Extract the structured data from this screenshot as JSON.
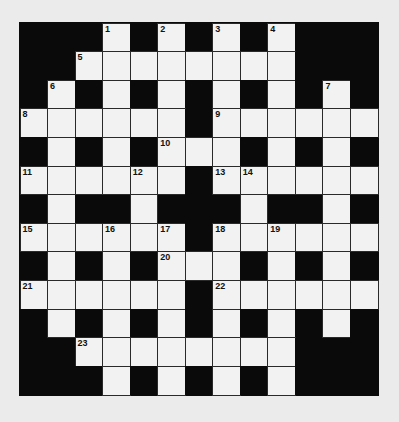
{
  "puzzle": {
    "type": "crossword",
    "rows": 13,
    "cols": 13,
    "colors": {
      "page_background": "#ebebeb",
      "block": "#0a0a0a",
      "cell": "#f2f2f2",
      "number": "#111111"
    },
    "grid": [
      "###.#.#.#.###",
      "##........###",
      "#.#.#.#.#.#.#",
      "......#......",
      "#.#.#...#.#.#",
      "......#......",
      "#.##.###.##.#",
      "......#......",
      "#.#.#...#.#.#",
      "......#......",
      "#.#.#.#.#.#.#",
      "##........###",
      "###.#.#.#.###"
    ],
    "numbers": [
      {
        "n": "1",
        "r": 0,
        "c": 3
      },
      {
        "n": "2",
        "r": 0,
        "c": 5
      },
      {
        "n": "3",
        "r": 0,
        "c": 7
      },
      {
        "n": "4",
        "r": 0,
        "c": 9
      },
      {
        "n": "5",
        "r": 1,
        "c": 2
      },
      {
        "n": "6",
        "r": 2,
        "c": 1
      },
      {
        "n": "7",
        "r": 2,
        "c": 11
      },
      {
        "n": "8",
        "r": 3,
        "c": 0
      },
      {
        "n": "9",
        "r": 3,
        "c": 7
      },
      {
        "n": "10",
        "r": 4,
        "c": 5
      },
      {
        "n": "11",
        "r": 5,
        "c": 0
      },
      {
        "n": "12",
        "r": 5,
        "c": 4
      },
      {
        "n": "13",
        "r": 5,
        "c": 7
      },
      {
        "n": "14",
        "r": 5,
        "c": 8
      },
      {
        "n": "15",
        "r": 7,
        "c": 0
      },
      {
        "n": "16",
        "r": 7,
        "c": 3
      },
      {
        "n": "17",
        "r": 7,
        "c": 5
      },
      {
        "n": "18",
        "r": 7,
        "c": 7
      },
      {
        "n": "19",
        "r": 7,
        "c": 9
      },
      {
        "n": "20",
        "r": 8,
        "c": 5
      },
      {
        "n": "21",
        "r": 9,
        "c": 0
      },
      {
        "n": "22",
        "r": 9,
        "c": 7
      },
      {
        "n": "23",
        "r": 11,
        "c": 2
      }
    ]
  }
}
